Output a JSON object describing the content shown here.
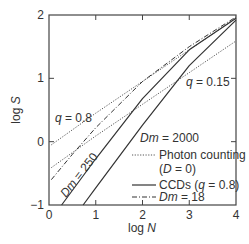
{
  "chart_data": {
    "type": "line",
    "title": "",
    "xlabel": "log N",
    "ylabel": "log S",
    "xlim": [
      0,
      4
    ],
    "ylim": [
      -1,
      2
    ],
    "xticks": [
      "0",
      "1",
      "2",
      "3",
      "4"
    ],
    "yticks": [
      "-1",
      "0",
      "1",
      "2"
    ],
    "grid": false,
    "legend_position": "lower right inside",
    "legend": [
      {
        "style": "dotted",
        "label": "Photon counting (D = 0)"
      },
      {
        "style": "solid",
        "label": "CCDs (q = 0.8)"
      },
      {
        "style": "dash-dot",
        "label": "Dm = 18"
      }
    ],
    "annotations": [
      "q = 0.8",
      "q = 0.15",
      "Dm = 250",
      "Dm = 2000"
    ],
    "series": [
      {
        "name": "Photon counting q = 0.8",
        "style": "dotted",
        "x": [
          0.05,
          1,
          2,
          3,
          4
        ],
        "y": [
          -0.05,
          0.45,
          0.95,
          1.45,
          1.95
        ]
      },
      {
        "name": "Photon counting q = 0.15",
        "style": "dotted",
        "x": [
          0.05,
          1,
          2,
          3,
          4
        ],
        "y": [
          -0.41,
          0.09,
          0.59,
          1.09,
          1.59
        ]
      },
      {
        "name": "CCD Dm = 18",
        "style": "dash-dot",
        "x": [
          0.05,
          0.5,
          1,
          2,
          3,
          4
        ],
        "y": [
          -0.6,
          -0.2,
          0.22,
          0.95,
          1.5,
          1.97
        ]
      },
      {
        "name": "CCD Dm = 250",
        "style": "solid",
        "x": [
          0.27,
          1,
          2,
          3,
          4
        ],
        "y": [
          -1,
          -0.27,
          0.68,
          1.45,
          1.95
        ]
      },
      {
        "name": "CCD Dm = 2000",
        "style": "solid",
        "x": [
          0.73,
          1,
          2,
          3,
          4
        ],
        "y": [
          -1,
          -0.73,
          0.26,
          1.2,
          1.92
        ]
      }
    ]
  },
  "labels": {
    "xlabel": "log N",
    "ylabel": "log S",
    "q08": "q = 0.8",
    "q015": "q = 0.15",
    "dm250": "Dm = 250",
    "dm2000": "Dm = 2000",
    "legend_photon_1": "Photon counting",
    "legend_photon_2": "(D = 0)",
    "legend_ccd": "CCDs (q = 0.8)",
    "legend_dm18": "Dm = 18"
  }
}
